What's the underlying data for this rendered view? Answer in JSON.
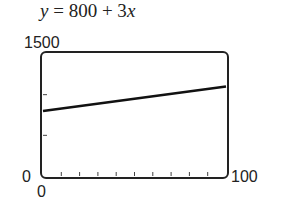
{
  "chart_data": {
    "type": "line",
    "title": "y = 800 + 3x",
    "equation": {
      "var_left": "y",
      "eq": " = 800 + 3",
      "var_right": "x"
    },
    "xlabel": "",
    "ylabel": "",
    "xlim": [
      0,
      100
    ],
    "ylim": [
      0,
      1500
    ],
    "x_tick_labels": {
      "min": "0",
      "max": "100"
    },
    "y_tick_labels": {
      "min": "0",
      "max": "1500"
    },
    "x_ticks": [
      10,
      20,
      30,
      40,
      50,
      60,
      70,
      80,
      90
    ],
    "y_ticks": [
      500,
      1000
    ],
    "grid": false,
    "series": [
      {
        "name": "y = 800 + 3x",
        "x": [
          0,
          100
        ],
        "values": [
          800,
          1100
        ]
      }
    ]
  }
}
